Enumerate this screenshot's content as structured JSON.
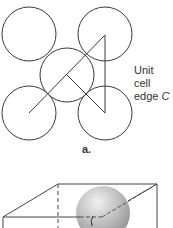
{
  "figure": {
    "panel_a": {
      "label": "a.",
      "annotation_line1": "Unit cell",
      "annotation_line2_prefix": "edge ",
      "annotation_line2_var": "C",
      "circles": [
        {
          "name": "top-left",
          "cx": 29,
          "cy": 34,
          "r": 27
        },
        {
          "name": "top-right",
          "cx": 105,
          "cy": 34,
          "r": 27
        },
        {
          "name": "center",
          "cx": 67,
          "cy": 75,
          "r": 27
        },
        {
          "name": "bottom-left",
          "cx": 29,
          "cy": 113,
          "r": 27
        },
        {
          "name": "bottom-right",
          "cx": 105,
          "cy": 113,
          "r": 27
        }
      ]
    },
    "panel_b": {
      "shape": "cube with sphere",
      "sphere_color": "#b8b8b8"
    },
    "colors": {
      "stroke": "#3a3a3a",
      "background": "#ffffff"
    }
  }
}
